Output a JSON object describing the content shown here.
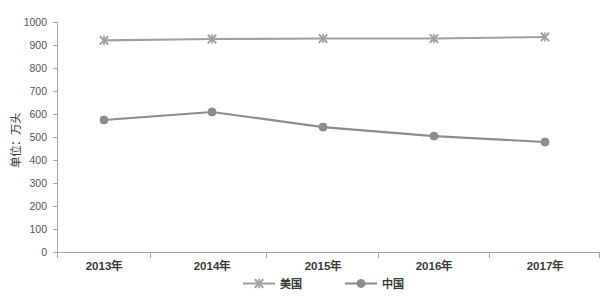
{
  "chart_data": {
    "type": "line",
    "title": "",
    "subtitle": "",
    "xlabel": "",
    "ylabel": "单位：万头",
    "categories": [
      "2013年",
      "2014年",
      "2015年",
      "2016年",
      "2017年"
    ],
    "series": [
      {
        "name": "美国",
        "marker": "x-cross",
        "color": "#a0a0a0",
        "values": [
          920,
          926,
          928,
          928,
          935
        ]
      },
      {
        "name": "中国",
        "marker": "circle",
        "color": "#8c8c8c",
        "values": [
          574,
          609,
          543,
          504,
          478
        ]
      }
    ],
    "ylim": [
      0,
      1000
    ],
    "y_ticks": [
      0,
      100,
      200,
      300,
      400,
      500,
      600,
      700,
      800,
      900,
      1000
    ],
    "y_tick_labels": [
      "0",
      "100",
      "200",
      "300",
      "400",
      "500",
      "600",
      "700",
      "800",
      "900",
      "1000"
    ],
    "grid": false,
    "legend_position": "bottom",
    "legend": [
      {
        "label": "美国",
        "marker": "x-cross",
        "color": "#a0a0a0"
      },
      {
        "label": "中国",
        "marker": "circle",
        "color": "#8c8c8c"
      }
    ],
    "colors": {
      "axis": "#a6a6a6",
      "tick_text": "#555555",
      "label_text": "#3a3a3a",
      "series_usa": "#a0a0a0",
      "series_china": "#8c8c8c",
      "background": "#ffffff"
    }
  }
}
